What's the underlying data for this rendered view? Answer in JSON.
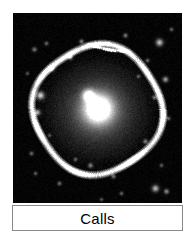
{
  "figure": {
    "caption": "Calls",
    "caption_border_color": "#8a8a8a",
    "caption_background": "#ffffff",
    "page_background": "#ffffff"
  },
  "image_panel": {
    "kind": "astronomical-image",
    "background_color": "#000000",
    "subject": "galaxy with bright nucleus, diffuse halo and outer shell ring",
    "width_px": 169,
    "height_px": 190
  },
  "chart_data": {
    "type": "heatmap",
    "title": "Calls",
    "xlabel": "",
    "ylabel": "",
    "colormap": "grayscale",
    "background": "#000000",
    "nucleus": {
      "x": 85,
      "y": 95,
      "peak_brightness": 255,
      "core_radius": 9
    },
    "halo": {
      "cx": 85,
      "cy": 97,
      "rx": 58,
      "ry": 56,
      "edge_brightness": 40
    },
    "shell_ring": {
      "cx": 84,
      "cy": 96,
      "rx": 64,
      "ry": 64,
      "thickness": 4,
      "brightness": 120
    },
    "secondary_knot": {
      "x": 75,
      "y": 82,
      "brightness": 235,
      "radius": 4
    },
    "streak": {
      "x1": 72,
      "y1": 30,
      "x2": 118,
      "y2": 38,
      "brightness": 150
    },
    "stars": [
      {
        "x": 21,
        "y": 36,
        "b": 110,
        "r": 1.6
      },
      {
        "x": 38,
        "y": 55,
        "b": 150,
        "r": 2.0
      },
      {
        "x": 27,
        "y": 82,
        "b": 200,
        "r": 2.6
      },
      {
        "x": 24,
        "y": 99,
        "b": 160,
        "r": 2.0
      },
      {
        "x": 33,
        "y": 30,
        "b": 95,
        "r": 1.4
      },
      {
        "x": 57,
        "y": 44,
        "b": 130,
        "r": 1.6
      },
      {
        "x": 68,
        "y": 28,
        "b": 120,
        "r": 1.5
      },
      {
        "x": 95,
        "y": 30,
        "b": 105,
        "r": 1.4
      },
      {
        "x": 112,
        "y": 22,
        "b": 115,
        "r": 1.5
      },
      {
        "x": 134,
        "y": 47,
        "b": 100,
        "r": 1.4
      },
      {
        "x": 146,
        "y": 29,
        "b": 185,
        "r": 2.4
      },
      {
        "x": 152,
        "y": 66,
        "b": 150,
        "r": 1.9
      },
      {
        "x": 158,
        "y": 16,
        "b": 95,
        "r": 1.3
      },
      {
        "x": 141,
        "y": 84,
        "b": 115,
        "r": 1.5
      },
      {
        "x": 155,
        "y": 105,
        "b": 100,
        "r": 1.4
      },
      {
        "x": 132,
        "y": 128,
        "b": 120,
        "r": 1.6
      },
      {
        "x": 148,
        "y": 152,
        "b": 90,
        "r": 1.3
      },
      {
        "x": 142,
        "y": 175,
        "b": 175,
        "r": 2.3
      },
      {
        "x": 153,
        "y": 178,
        "b": 130,
        "r": 1.7
      },
      {
        "x": 100,
        "y": 163,
        "b": 110,
        "r": 1.5
      },
      {
        "x": 77,
        "y": 152,
        "b": 120,
        "r": 1.6
      },
      {
        "x": 62,
        "y": 146,
        "b": 95,
        "r": 1.3
      },
      {
        "x": 46,
        "y": 170,
        "b": 105,
        "r": 1.4
      },
      {
        "x": 22,
        "y": 160,
        "b": 90,
        "r": 1.3
      },
      {
        "x": 18,
        "y": 140,
        "b": 100,
        "r": 1.4
      },
      {
        "x": 36,
        "y": 122,
        "b": 85,
        "r": 1.2
      },
      {
        "x": 108,
        "y": 180,
        "b": 95,
        "r": 1.3
      },
      {
        "x": 88,
        "y": 186,
        "b": 85,
        "r": 1.2
      },
      {
        "x": 14,
        "y": 60,
        "b": 85,
        "r": 1.2
      },
      {
        "x": 125,
        "y": 63,
        "b": 90,
        "r": 1.3
      }
    ]
  }
}
